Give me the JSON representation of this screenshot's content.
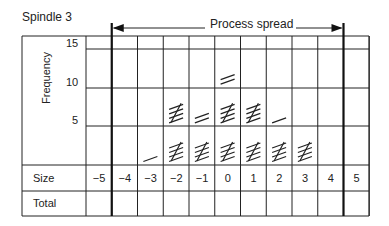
{
  "title": "Spindle 3",
  "spread_label": "Process spread",
  "y_axis": {
    "label": "Frequency",
    "ticks": [
      "15",
      "10",
      "5"
    ]
  },
  "row_labels": {
    "size": "Size",
    "total": "Total"
  },
  "sizes": [
    "−5",
    "−4",
    "−3",
    "−2",
    "−1",
    "0",
    "1",
    "2",
    "3",
    "4",
    "5"
  ],
  "totals": [
    "",
    "",
    "",
    "",
    "",
    "",
    "",
    "",
    "",
    "",
    ""
  ],
  "chart_data": {
    "type": "table",
    "title": "Spindle 3",
    "xlabel": "Size",
    "ylabel": "Frequency",
    "categories": [
      -5,
      -4,
      -3,
      -2,
      -1,
      0,
      1,
      2,
      3,
      4,
      5
    ],
    "tally_counts": [
      0,
      0,
      1,
      10,
      7,
      12,
      10,
      6,
      5,
      0,
      0
    ],
    "ylim": [
      0,
      15
    ],
    "process_spread": {
      "from": -4,
      "to": 4
    }
  }
}
